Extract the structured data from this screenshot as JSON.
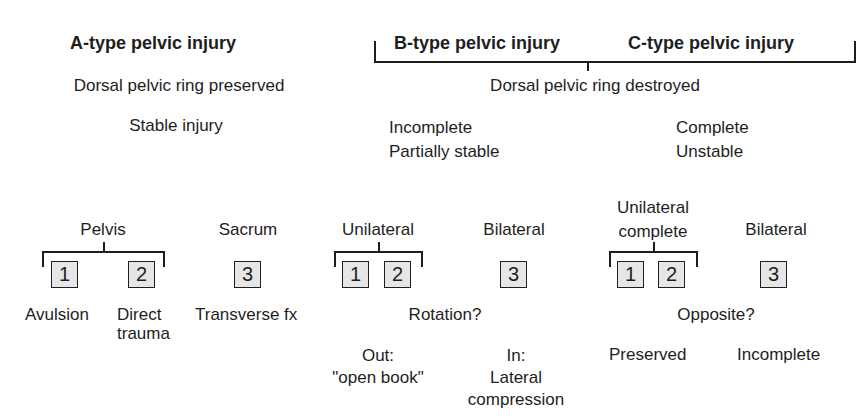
{
  "headers": {
    "a_type": "A-type pelvic injury",
    "b_type": "B-type pelvic injury",
    "c_type": "C-type pelvic injury"
  },
  "dorsal": {
    "a": "Dorsal pelvic ring preserved",
    "bc": "Dorsal pelvic ring destroyed"
  },
  "stability": {
    "a": "Stable injury",
    "b": "Incomplete\nPartially stable",
    "c": "Complete\nUnstable"
  },
  "a_group": {
    "pelvis_label": "Pelvis",
    "sacrum_label": "Sacrum",
    "box1": "1",
    "box2": "2",
    "box3": "3",
    "desc1": "Avulsion",
    "desc2": "Direct\ntrauma",
    "desc3": "Transverse fx"
  },
  "b_group": {
    "unilateral_label": "Unilateral",
    "bilateral_label": "Bilateral",
    "box1": "1",
    "box2": "2",
    "box3": "3",
    "question": "Rotation?",
    "out": "Out:\n\"open book\"",
    "in": "In:\nLateral\ncompression"
  },
  "c_group": {
    "unilateral_label": "Unilateral\ncomplete",
    "bilateral_label": "Bilateral",
    "box1": "1",
    "box2": "2",
    "box3": "3",
    "question": "Opposite?",
    "preserved": "Preserved",
    "incomplete": "Incomplete"
  }
}
